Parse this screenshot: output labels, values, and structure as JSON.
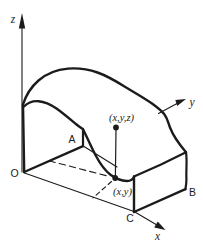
{
  "figure": {
    "description_role": "hand-drawn 3d solid volume diagram",
    "colors": {
      "ink": "#1b1b1b",
      "background": "#ffffff"
    },
    "axis_labels": {
      "z": "z",
      "y": "y",
      "x": "x"
    },
    "corner_labels": {
      "origin": "O",
      "a": "A",
      "b": "B",
      "c": "C"
    },
    "point_labels": {
      "surface_point": "(x,y,z)",
      "base_point": "(x,y)"
    }
  }
}
